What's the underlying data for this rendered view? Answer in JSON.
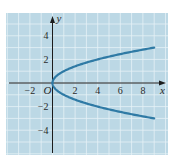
{
  "chart_data": {
    "type": "line",
    "title": "",
    "xlabel": "x",
    "ylabel": "y",
    "origin_label": "O",
    "equation": "x = y^2 (y = ±√x)",
    "xlim": [
      -4.2,
      10.2
    ],
    "ylim": [
      -5.5,
      5.7
    ],
    "grid": true,
    "x_ticks": [
      -2,
      2,
      4,
      6,
      8
    ],
    "x_tick_labels": [
      "−2",
      "2",
      "4",
      "6",
      "8"
    ],
    "y_ticks": [
      4,
      2,
      -2,
      -4
    ],
    "y_tick_labels": [
      "4",
      "2",
      "−2",
      "−4"
    ],
    "series": [
      {
        "name": "upper branch",
        "x": [
          0,
          0.25,
          1,
          2,
          3,
          4,
          5,
          6,
          7,
          8,
          9
        ],
        "y": [
          0,
          0.5,
          1,
          1.414,
          1.732,
          2,
          2.236,
          2.449,
          2.646,
          2.828,
          3
        ]
      },
      {
        "name": "lower branch",
        "x": [
          0,
          0.25,
          1,
          2,
          3,
          4,
          5,
          6,
          7,
          8,
          9
        ],
        "y": [
          0,
          -0.5,
          -1,
          -1.414,
          -1.732,
          -2,
          -2.236,
          -2.449,
          -2.646,
          -2.828,
          -3
        ]
      }
    ]
  },
  "colors": {
    "panel": "#bcd8e5",
    "grid": "#e6f1f6",
    "curve": "#2f7aa5",
    "axis": "#1c1c1c"
  }
}
